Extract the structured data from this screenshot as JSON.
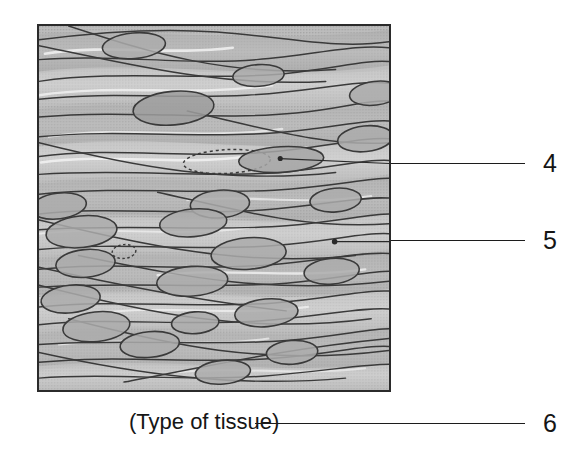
{
  "figure": {
    "type": "histology-illustration",
    "frame": {
      "x": 37,
      "y": 24,
      "width": 354,
      "height": 368,
      "border_color": "#2b2b2b",
      "fill_color": "#b9b9b9"
    },
    "colors": {
      "background": "#ffffff",
      "tissue_base": "#b9b9b9",
      "tissue_light": "#d2d2d2",
      "tissue_highlight": "#e8e8e8",
      "tissue_dark": "#9a9a9a",
      "nucleus_fill": "#a9a9a9",
      "line": "#3a3a3a",
      "ink": "#151515"
    }
  },
  "callouts": [
    {
      "id": "callout-4",
      "number": "4",
      "number_x": 543,
      "number_y": 151,
      "line_x": 391,
      "line_y": 163,
      "line_width": 134,
      "pointer_dot": {
        "x": 281,
        "y": 158
      }
    },
    {
      "id": "callout-5",
      "number": "5",
      "number_x": 543,
      "number_y": 228,
      "line_x": 391,
      "line_y": 240,
      "line_width": 134,
      "pointer_dot": {
        "x": 336,
        "y": 242
      }
    },
    {
      "id": "callout-6",
      "number": "6",
      "number_x": 543,
      "number_y": 411,
      "line_x": 255,
      "line_y": 423,
      "line_width": 270
    }
  ],
  "caption": {
    "label": "(Type of tissue)",
    "x": 129,
    "y": 410
  }
}
